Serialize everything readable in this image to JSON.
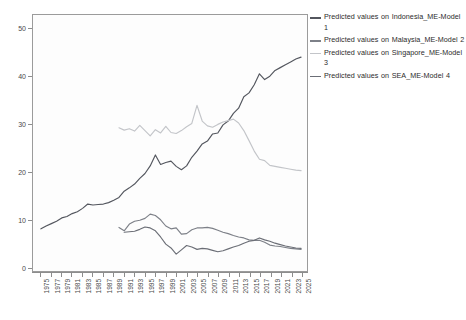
{
  "chart_data": {
    "type": "line",
    "title": "",
    "subtitle": "",
    "xlabel": "",
    "ylabel": "",
    "xlim": [
      1975,
      2025
    ],
    "ylim": [
      0,
      52
    ],
    "grid": false,
    "legend_position": "right",
    "y_ticks": [
      0,
      10,
      20,
      30,
      40,
      50
    ],
    "x_ticks": [
      1975,
      1977,
      1979,
      1981,
      1983,
      1985,
      1987,
      1989,
      1991,
      1993,
      1995,
      1997,
      1999,
      2001,
      2003,
      2005,
      2007,
      2009,
      2011,
      2013,
      2015,
      2017,
      2019,
      2021,
      2023,
      2025
    ],
    "series": [
      {
        "name": "Predicted values on Indonesia_ME-Model 1",
        "color": "#53565e",
        "x": [
          1975,
          1976,
          1977,
          1978,
          1979,
          1980,
          1981,
          1982,
          1983,
          1984,
          1985,
          1986,
          1987,
          1988,
          1989,
          1990,
          1991,
          1992,
          1993,
          1994,
          1995,
          1996,
          1997,
          1998,
          1999,
          2000,
          2001,
          2002,
          2003,
          2004,
          2005,
          2006,
          2007,
          2008,
          2009,
          2010,
          2011,
          2012,
          2013,
          2014,
          2015,
          2016,
          2017,
          2018,
          2019,
          2020,
          2021,
          2022,
          2023,
          2024,
          2025
        ],
        "values": [
          8.0,
          8.6,
          9.1,
          9.6,
          10.3,
          10.6,
          11.2,
          11.6,
          12.3,
          13.2,
          13.0,
          13.1,
          13.2,
          13.5,
          14.0,
          14.6,
          15.9,
          16.6,
          17.4,
          18.6,
          19.6,
          21.2,
          23.5,
          21.5,
          21.9,
          22.2,
          21.1,
          20.4,
          21.2,
          23.0,
          24.3,
          25.8,
          26.4,
          27.9,
          28.1,
          29.8,
          30.6,
          32.2,
          33.3,
          35.7,
          36.5,
          38.2,
          40.5,
          39.3,
          40.0,
          41.2,
          41.8,
          42.4,
          43.0,
          43.6,
          44.0
        ]
      },
      {
        "name": "Predicted values on Malaysia_ME-Model 2",
        "color": "#7d8088",
        "x": [
          1990,
          1991,
          1992,
          1993,
          1994,
          1995,
          1996,
          1997,
          1998,
          1999,
          2000,
          2001,
          2002,
          2003,
          2004,
          2005,
          2006,
          2007,
          2008,
          2009,
          2010,
          2011,
          2012,
          2013,
          2014,
          2015,
          2016,
          2017,
          2018,
          2019,
          2020,
          2021,
          2022,
          2023,
          2024,
          2025
        ],
        "values": [
          8.3,
          7.6,
          9.0,
          9.6,
          9.8,
          10.2,
          11.1,
          10.8,
          9.9,
          8.6,
          8.0,
          8.2,
          6.9,
          7.0,
          7.8,
          8.2,
          8.2,
          8.3,
          8.1,
          7.7,
          7.3,
          7.0,
          6.6,
          6.3,
          6.1,
          5.7,
          5.6,
          5.6,
          5.2,
          4.6,
          4.4,
          4.3,
          4.1,
          3.9,
          3.8,
          3.7
        ]
      },
      {
        "name": "Predicted values on Singapore_ME-Model 3",
        "color": "#c3c5c9",
        "x": [
          1990,
          1991,
          1992,
          1993,
          1994,
          1995,
          1996,
          1997,
          1998,
          1999,
          2000,
          2001,
          2002,
          2003,
          2004,
          2005,
          2006,
          2007,
          2008,
          2009,
          2010,
          2011,
          2012,
          2013,
          2014,
          2015,
          2016,
          2017,
          2018,
          2019,
          2020,
          2021,
          2022,
          2023,
          2024,
          2025
        ],
        "values": [
          29.2,
          28.7,
          29.0,
          28.5,
          29.7,
          28.6,
          27.5,
          28.8,
          28.1,
          29.5,
          28.2,
          28.0,
          28.6,
          29.4,
          30.1,
          33.9,
          30.6,
          29.6,
          29.3,
          29.9,
          30.4,
          30.7,
          31.0,
          30.2,
          28.6,
          26.5,
          24.3,
          22.6,
          22.3,
          21.3,
          21.1,
          20.9,
          20.7,
          20.5,
          20.3,
          20.2
        ]
      },
      {
        "name": "Predicted values on SEA_ME-Model 4",
        "color": "#6b6e76",
        "x": [
          1991,
          1992,
          1993,
          1994,
          1995,
          1996,
          1997,
          1998,
          1999,
          2000,
          2001,
          2002,
          2003,
          2004,
          2005,
          2006,
          2007,
          2008,
          2009,
          2010,
          2011,
          2012,
          2013,
          2014,
          2015,
          2016,
          2017,
          2018,
          2019,
          2020,
          2021,
          2022,
          2023,
          2024,
          2025
        ],
        "values": [
          7.3,
          7.4,
          7.5,
          7.9,
          8.4,
          8.2,
          7.6,
          6.3,
          4.8,
          4.0,
          2.7,
          3.6,
          4.5,
          4.2,
          3.7,
          3.9,
          3.8,
          3.5,
          3.2,
          3.4,
          3.8,
          4.2,
          4.5,
          5.0,
          5.4,
          5.6,
          6.1,
          5.7,
          5.4,
          5.0,
          4.7,
          4.4,
          4.2,
          4.0,
          3.9
        ]
      }
    ]
  },
  "legend": {
    "items": [
      {
        "label": "Predicted values  on Indonesia_ME-Model 1",
        "color": "#53565e",
        "swatch": "line-swatch"
      },
      {
        "label": "Predicted values  on Malaysia_ME-Model 2",
        "color": "#7d8088",
        "swatch": "line-swatch"
      },
      {
        "label": "Predicted values  on Singapore_ME-Model 3",
        "color": "#c3c5c9",
        "swatch": "line-swatch"
      },
      {
        "label": "Predicted values  on SEA_ME-Model 4",
        "color": "#6b6e76",
        "swatch": "line-swatch"
      }
    ]
  },
  "axes": {
    "y_tick_labels": [
      "50",
      "40",
      "30",
      "20",
      "10",
      "0"
    ],
    "x_tick_labels": [
      "1975",
      "1977",
      "1979",
      "1981",
      "1983",
      "1985",
      "1987",
      "1989",
      "1991",
      "1993",
      "1995",
      "1997",
      "1999",
      "2001",
      "2003",
      "2005",
      "2007",
      "2009",
      "2011",
      "2013",
      "2015",
      "2017",
      "2019",
      "2021",
      "2023",
      "2025"
    ]
  }
}
